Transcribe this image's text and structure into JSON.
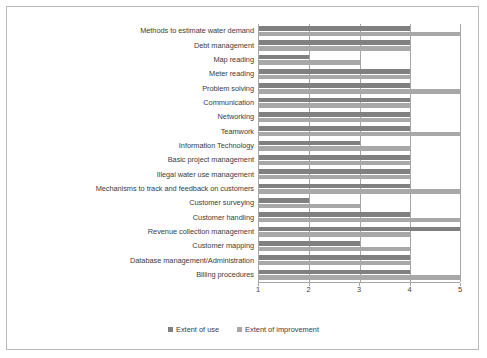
{
  "chart_data": {
    "type": "bar",
    "orientation": "horizontal",
    "title": "",
    "xlabel": "",
    "ylabel": "",
    "xlim": [
      1,
      5
    ],
    "xticks": [
      "1",
      "2",
      "3",
      "4",
      "5"
    ],
    "grid": true,
    "legend_position": "bottom",
    "categories": [
      "Methods to estimate water demand",
      "Debt management",
      "Map reading",
      "Meter reading",
      "Problem solving",
      "Communication",
      "Networking",
      "Teamwork",
      "Information Technology",
      "Basic project management",
      "Illegal water use management",
      "Mechanisms to track and feedback on customers",
      "Customer surveying",
      "Customer handling",
      "Revenue collection management",
      "Customer mapping",
      "Database management/Administration",
      "Billing procedures"
    ],
    "series": [
      {
        "name": "Extent of use",
        "color": "#808080",
        "values": [
          4,
          4,
          2,
          4,
          4,
          4,
          4,
          4,
          3,
          4,
          4,
          4,
          2,
          4,
          5,
          3,
          4,
          4
        ]
      },
      {
        "name": "Extent of improvement",
        "color": "#a8a8a8",
        "values": [
          5,
          4,
          3,
          4,
          5,
          4,
          4,
          5,
          4,
          4,
          4,
          5,
          3,
          5,
          4,
          4,
          4,
          5
        ]
      }
    ]
  },
  "legend": {
    "items": [
      {
        "label": "Extent of use",
        "color": "#808080"
      },
      {
        "label": "Extent of improvement",
        "color": "#a8a8a8"
      }
    ]
  }
}
